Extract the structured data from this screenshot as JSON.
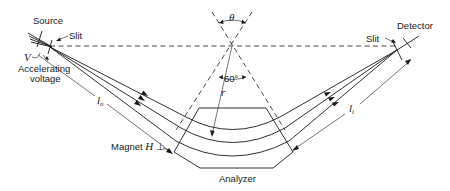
{
  "diagram": {
    "labels": {
      "source": "Source",
      "slit_left": "Slit",
      "accelerating_voltage_symbol": "V",
      "accelerating_voltage_line1": "Accelerating",
      "accelerating_voltage_line2": "voltage",
      "detector": "Detector",
      "slit_right": "Slit",
      "theta": "θ",
      "angle_60": "60°",
      "radius": "r",
      "object_distance": "l",
      "object_distance_sub": "o",
      "image_distance": "l",
      "image_distance_sub": "i",
      "magnet": "Magnet ",
      "magnet_field": "H",
      "magnet_perp": " ⊥",
      "analyzer": "Analyzer"
    },
    "colors": {
      "ink": "#1a1a1a",
      "background": "#ffffff"
    }
  }
}
